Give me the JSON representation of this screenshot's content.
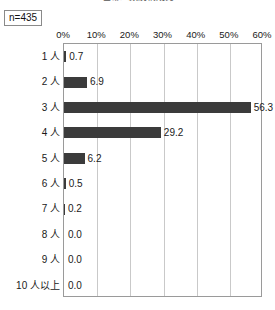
{
  "chart_title": "世帯人数別構成比",
  "sample_size_label": "n=435",
  "chart_data": {
    "type": "bar",
    "orientation": "horizontal",
    "title": "世帯人数別構成比",
    "xlabel": "",
    "ylabel": "",
    "xlim": [
      0,
      60
    ],
    "xticks": [
      0,
      10,
      20,
      30,
      40,
      50,
      60
    ],
    "xtick_labels": [
      "0%",
      "10%",
      "20%",
      "30%",
      "40%",
      "50%",
      "60%"
    ],
    "grid": true,
    "legend": false,
    "bar_color": "#3b3b3b",
    "gridline_color": "#c9c9c9",
    "axis_color": "#9a9a9a",
    "sample_size": "n=435",
    "categories": [
      "1 人",
      "2 人",
      "3 人",
      "4 人",
      "5 人",
      "6 人",
      "7 人",
      "8 人",
      "9 人",
      "10 人以上"
    ],
    "values": [
      0.7,
      6.9,
      56.3,
      29.2,
      6.2,
      0.5,
      0.2,
      0.0,
      0.0,
      0.0
    ],
    "value_labels": [
      "0.7",
      "6.9",
      "56.3",
      "29.2",
      "6.2",
      "0.5",
      "0.2",
      "0.0",
      "0.0",
      "0.0"
    ]
  }
}
